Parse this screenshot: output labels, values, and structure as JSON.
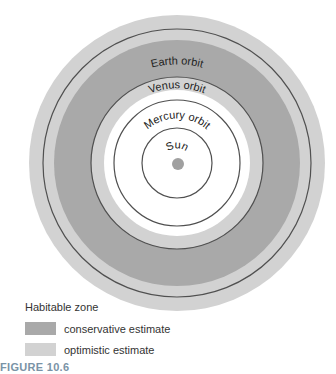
{
  "diagram": {
    "center": {
      "x": 177,
      "y": 163
    },
    "colors": {
      "background": "#ffffff",
      "conservative": "#a9a9a9",
      "optimistic": "#d2d2d2",
      "orbit_line": "#505050",
      "sun": "#a0a0a0"
    },
    "zones": {
      "optimistic_outer_r": 148,
      "conservative_outer_r": 123,
      "conservative_inner_r": 86,
      "optimistic_inner_r": 73
    },
    "orbits": [
      {
        "name": "Mars orbit",
        "r": 134
      },
      {
        "name": "Earth orbit",
        "r": 86
      },
      {
        "name": "Venus orbit",
        "r": 63
      },
      {
        "name": "Mercury orbit",
        "r": 35
      }
    ],
    "sun": {
      "label": "Sun",
      "r": 6
    }
  },
  "labels": {
    "mars": "Mars orbit",
    "earth": "Earth orbit",
    "venus": "Venus orbit",
    "mercury": "Mercury orbit",
    "sun": "Sun"
  },
  "legend": {
    "title": "Habitable zone",
    "items": [
      {
        "label": "conservative estimate",
        "color": "#a9a9a9"
      },
      {
        "label": "optimistic estimate",
        "color": "#d2d2d2"
      }
    ]
  },
  "caption": "FIGURE 10.6"
}
